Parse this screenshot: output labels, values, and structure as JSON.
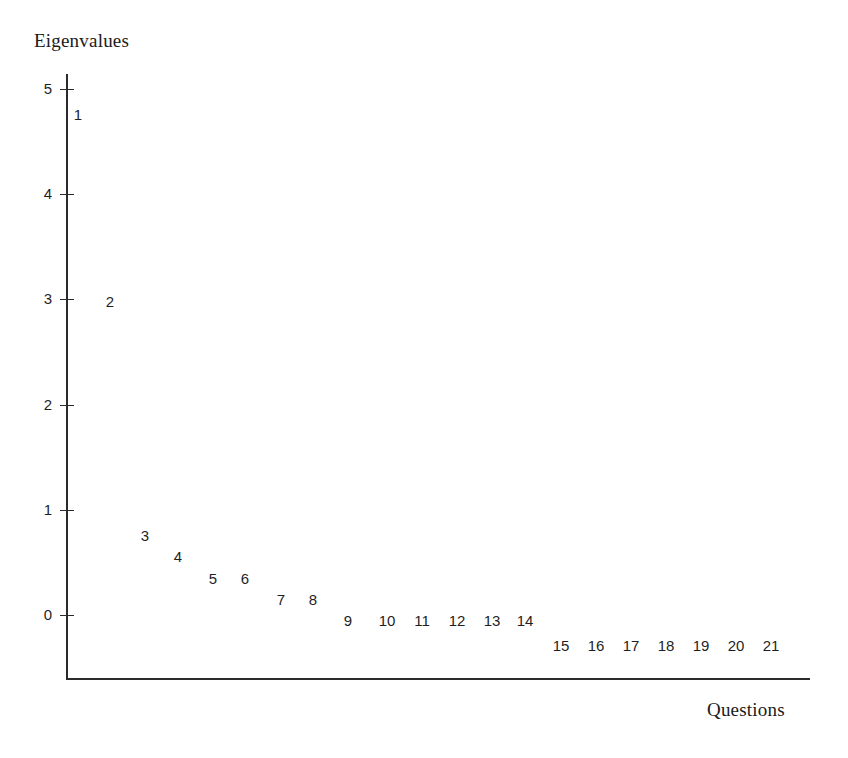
{
  "figure": {
    "y_axis_title": "Eigenvalues",
    "x_axis_title": "Questions"
  },
  "axis": {
    "y_ticks": [
      {
        "label": "5",
        "value": 5
      },
      {
        "label": "4",
        "value": 4
      },
      {
        "label": "3",
        "value": 3
      },
      {
        "label": "2",
        "value": 2
      },
      {
        "label": "1",
        "value": 1
      },
      {
        "label": "0",
        "value": 0
      }
    ]
  },
  "chart_data": {
    "type": "scatter",
    "title": "",
    "subtitle": "",
    "xlabel": "Questions",
    "ylabel": "Eigenvalues",
    "xlim": [
      0,
      22
    ],
    "ylim": [
      -0.5,
      5.2
    ],
    "yticks": [
      0,
      1,
      2,
      3,
      4,
      5
    ],
    "ytick_labels": [
      "0",
      "1",
      "2",
      "3",
      "4",
      "5"
    ],
    "xticks": [],
    "xtick_labels": [],
    "grid": false,
    "legend": null,
    "point_marker": "numeric-label",
    "note": "Scree plot; each data point is drawn as its component number rather than a marker glyph.",
    "categories": [
      "1",
      "2",
      "3",
      "4",
      "5",
      "6",
      "7",
      "8",
      "9",
      "10",
      "11",
      "12",
      "13",
      "14",
      "15",
      "16",
      "17",
      "18",
      "19",
      "20",
      "21"
    ],
    "x": [
      1,
      2,
      3,
      4,
      5,
      6,
      7,
      8,
      9,
      10,
      11,
      12,
      13,
      14,
      15,
      16,
      17,
      18,
      19,
      20,
      21
    ],
    "values": [
      4.76,
      2.98,
      0.76,
      0.56,
      0.35,
      0.35,
      0.15,
      0.15,
      -0.05,
      -0.05,
      -0.05,
      -0.05,
      -0.05,
      -0.05,
      -0.29,
      -0.29,
      -0.29,
      -0.29,
      -0.29,
      -0.29,
      -0.29
    ],
    "series": [
      {
        "name": "Eigenvalues",
        "values": [
          4.76,
          2.98,
          0.76,
          0.56,
          0.35,
          0.35,
          0.15,
          0.15,
          -0.05,
          -0.05,
          -0.05,
          -0.05,
          -0.05,
          -0.05,
          -0.29,
          -0.29,
          -0.29,
          -0.29,
          -0.29,
          -0.29,
          -0.29
        ]
      }
    ],
    "points": [
      {
        "label": "1",
        "x": 1,
        "y": 4.76,
        "px": 78,
        "py": 114
      },
      {
        "label": "2",
        "x": 2,
        "y": 2.98,
        "px": 110,
        "py": 301
      },
      {
        "label": "3",
        "x": 3,
        "y": 0.76,
        "px": 145,
        "py": 535
      },
      {
        "label": "4",
        "x": 4,
        "y": 0.56,
        "px": 178,
        "py": 556
      },
      {
        "label": "5",
        "x": 5,
        "y": 0.35,
        "px": 213,
        "py": 578
      },
      {
        "label": "6",
        "x": 6,
        "y": 0.35,
        "px": 245,
        "py": 578
      },
      {
        "label": "7",
        "x": 7,
        "y": 0.15,
        "px": 281,
        "py": 599
      },
      {
        "label": "8",
        "x": 8,
        "y": 0.15,
        "px": 313,
        "py": 599
      },
      {
        "label": "9",
        "x": 9,
        "y": -0.05,
        "px": 348,
        "py": 620
      },
      {
        "label": "10",
        "x": 10,
        "y": -0.05,
        "px": 387,
        "py": 620
      },
      {
        "label": "11",
        "x": 11,
        "y": -0.05,
        "px": 422,
        "py": 620
      },
      {
        "label": "12",
        "x": 12,
        "y": -0.05,
        "px": 457,
        "py": 620
      },
      {
        "label": "13",
        "x": 13,
        "y": -0.05,
        "px": 492,
        "py": 620
      },
      {
        "label": "14",
        "x": 14,
        "y": -0.05,
        "px": 525,
        "py": 620
      },
      {
        "label": "15",
        "x": 15,
        "y": -0.29,
        "px": 561,
        "py": 645
      },
      {
        "label": "16",
        "x": 16,
        "y": -0.29,
        "px": 596,
        "py": 645
      },
      {
        "label": "17",
        "x": 17,
        "y": -0.29,
        "px": 631,
        "py": 645
      },
      {
        "label": "18",
        "x": 18,
        "y": -0.29,
        "px": 666,
        "py": 645
      },
      {
        "label": "19",
        "x": 19,
        "y": -0.29,
        "px": 701,
        "py": 645
      },
      {
        "label": "20",
        "x": 20,
        "y": -0.29,
        "px": 736,
        "py": 645
      },
      {
        "label": "21",
        "x": 21,
        "y": -0.29,
        "px": 771,
        "py": 645
      }
    ]
  },
  "colors": {
    "background": "#ffffff",
    "axis": "#2b2b2b",
    "text": "#1f1f1f",
    "title_text": "#1a1a1a"
  }
}
